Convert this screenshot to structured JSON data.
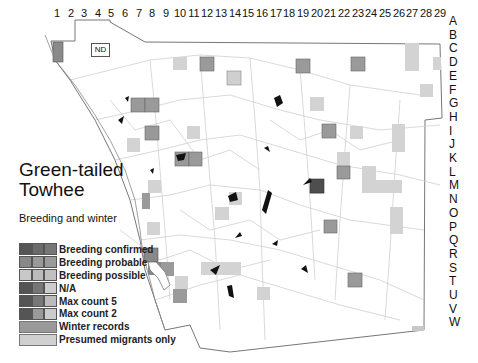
{
  "title": "Green-tailed Towhee",
  "title_line1": "Green-tailed",
  "title_line2": "Towhee",
  "subtitle": "Breeding and winter",
  "grid": {
    "columns": [
      "1",
      "2",
      "3",
      "4",
      "5",
      "6",
      "7",
      "8",
      "9",
      "10",
      "11",
      "12",
      "13",
      "14",
      "15",
      "16",
      "17",
      "18",
      "19",
      "20",
      "21",
      "22",
      "23",
      "24",
      "25",
      "26",
      "27",
      "28",
      "29"
    ],
    "rows": [
      "A",
      "B",
      "C",
      "D",
      "E",
      "F",
      "G",
      "H",
      "I",
      "J",
      "K",
      "L",
      "M",
      "N",
      "O",
      "P",
      "Q",
      "R",
      "S",
      "T",
      "U",
      "V",
      "W"
    ]
  },
  "no_data_label": "ND",
  "legend": {
    "items": [
      {
        "label": "Breeding confirmed",
        "colors": [
          "#555555",
          "#6a6a6a",
          "#777777"
        ]
      },
      {
        "label": "Breeding probable",
        "colors": [
          "#888888",
          "#999999",
          "#9a9a9a"
        ]
      },
      {
        "label": "Breeding possible",
        "colors": [
          "#c8c8c8",
          "#bbbbbb",
          "#c0c0c0"
        ]
      },
      {
        "label": "N/A",
        "colors": [
          "#555555",
          "#777777",
          "#cccccc"
        ]
      },
      {
        "label": "Max count 5",
        "colors": [
          "#555555",
          "#777777",
          "#bbbbbb"
        ]
      },
      {
        "label": "Max count 2",
        "colors": [
          "#555555",
          "#999999",
          "#cccccc"
        ]
      },
      {
        "label": "Winter records",
        "colors": [
          "#999999"
        ]
      },
      {
        "label": "Presumed migrants only",
        "colors": [
          "#d0d0d0"
        ]
      }
    ]
  },
  "colors": {
    "winter": "#9a9a9a",
    "migrant": "#d3d3d3",
    "confirmed": "#555555",
    "road": "#c8c8c8",
    "boundary": "#6a6a6a",
    "lake": "#111111"
  }
}
